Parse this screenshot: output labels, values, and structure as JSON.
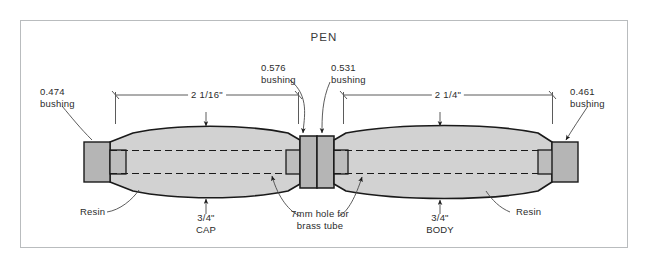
{
  "sheet": {
    "title": "PEN",
    "border_color": "#b9bcbe",
    "background": "#ffffff"
  },
  "colors": {
    "bushing_fill": "#b5b5b5",
    "resin_fill": "#d2d2d2",
    "tube_fill": "#bdbdbd",
    "outline": "#1a1a1a",
    "dim_line": "#5b5b5b",
    "text": "#2b2b2b"
  },
  "callouts": {
    "bushing_left": {
      "value": "0.474",
      "label": "bushing"
    },
    "bushing_cap_inner": {
      "value": "0.576",
      "label": "bushing"
    },
    "bushing_body_inner": {
      "value": "0.531",
      "label": "bushing"
    },
    "bushing_right": {
      "value": "0.461",
      "label": "bushing"
    },
    "resin_left": "Resin",
    "resin_right": "Resin",
    "hole_line1": "7mm hole for",
    "hole_line2": "brass tube"
  },
  "dimensions": {
    "cap_length": "2 1/16\"",
    "body_length": "2 1/4\""
  },
  "parts": {
    "cap": {
      "diameter": "3/4\"",
      "name": "CAP"
    },
    "body": {
      "diameter": "3/4\"",
      "name": "BODY"
    }
  }
}
